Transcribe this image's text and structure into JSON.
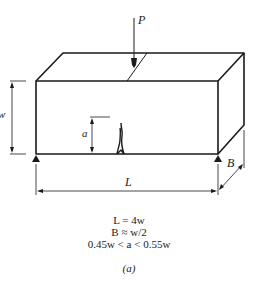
{
  "figure": {
    "labels": {
      "load": "P",
      "width": "w",
      "crack_length": "a",
      "span": "L",
      "thickness": "B"
    },
    "equations": [
      "L = 4w",
      "B ≈ w/2",
      "0.45w < a < 0.55w"
    ],
    "caption": "(a)",
    "colors": {
      "line": "#1a1a1a",
      "background": "#ffffff"
    }
  }
}
